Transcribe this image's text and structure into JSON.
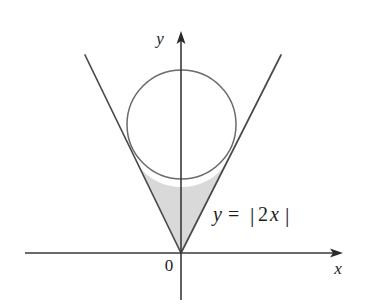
{
  "figure": {
    "background_color": "#ffffff",
    "axes": {
      "x_axis_label": "x",
      "y_axis_label": "y",
      "origin_label": "0",
      "x_axis_y": 253,
      "y_axis_x": 181,
      "x_axis_start": 25,
      "x_axis_end": 343,
      "y_axis_top": 33,
      "y_axis_bottom": 300,
      "axis_color": "#3a3a3a",
      "arrow_color": "#2b2b2b"
    },
    "equation": {
      "lhs": "y",
      "equals": "=",
      "bar_left": "|",
      "coefficient": "2",
      "variable": "x",
      "bar_right": "|",
      "full_text": "y = |2x|",
      "x": 212,
      "y": 220
    },
    "circle": {
      "center_x": 181.5,
      "center_y": 124.5,
      "radius": 54.5,
      "stroke_color": "#6a6a6a"
    },
    "vee": {
      "vertex_x": 181,
      "vertex_y": 253,
      "left_tip_x": 85,
      "left_tip_y": 55,
      "right_tip_x": 281,
      "right_tip_y": 55,
      "slope": 2.06,
      "stroke_color": "#4a4a4a"
    },
    "shaded_region": {
      "fill_color": "#d9d9d9",
      "left_tangent_x": 137,
      "left_tangent_y": 164,
      "right_tangent_x": 226,
      "right_tangent_y": 164,
      "description": "Region bounded below by the vertex of y=|2x| and above by the lower arc of the circle"
    }
  }
}
